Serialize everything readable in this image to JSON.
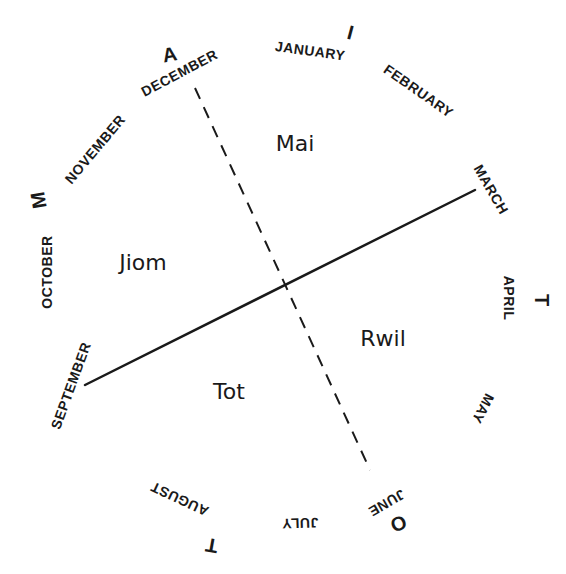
{
  "diagram": {
    "type": "seasonal calendar wheel",
    "months": [
      {
        "label": "JANUARY",
        "x": 310,
        "y": 52,
        "rotate": 8
      },
      {
        "label": "FEBRUARY",
        "x": 418,
        "y": 92,
        "rotate": 35
      },
      {
        "label": "MARCH",
        "x": 490,
        "y": 190,
        "rotate": 60
      },
      {
        "label": "APRIL",
        "x": 508,
        "y": 298,
        "rotate": 90
      },
      {
        "label": "MAY",
        "x": 482,
        "y": 408,
        "rotate": 118
      },
      {
        "label": "JUNE",
        "x": 386,
        "y": 502,
        "rotate": 150
      },
      {
        "label": "JULY",
        "x": 300,
        "y": 522,
        "rotate": 178
      },
      {
        "label": "AUGUST",
        "x": 180,
        "y": 498,
        "rotate": 205
      },
      {
        "label": "SEPTEMBER",
        "x": 72,
        "y": 386,
        "rotate": -70
      },
      {
        "label": "OCTOBER",
        "x": 48,
        "y": 272,
        "rotate": -90
      },
      {
        "label": "NOVEMBER",
        "x": 96,
        "y": 150,
        "rotate": -50
      },
      {
        "label": "DECEMBER",
        "x": 180,
        "y": 74,
        "rotate": -28
      }
    ],
    "markers": [
      {
        "label": "A",
        "x": 170,
        "y": 56,
        "rotate": -10
      },
      {
        "label": "I",
        "x": 350,
        "y": 34,
        "rotate": 15
      },
      {
        "label": "M",
        "x": 40,
        "y": 200,
        "rotate": -100
      },
      {
        "label": "T",
        "x": 540,
        "y": 300,
        "rotate": 90
      },
      {
        "label": "O",
        "x": 398,
        "y": 522,
        "rotate": 160
      },
      {
        "label": "T",
        "x": 212,
        "y": 544,
        "rotate": 190
      }
    ],
    "seasons": [
      {
        "label": "Mai",
        "x": 295,
        "y": 145
      },
      {
        "label": "Jiom",
        "x": 143,
        "y": 264
      },
      {
        "label": "Rwil",
        "x": 383,
        "y": 340
      },
      {
        "label": "Tot",
        "x": 229,
        "y": 393
      }
    ],
    "solid_line": {
      "x1": 85,
      "y1": 385,
      "x2": 475,
      "y2": 190
    },
    "dashed_line": {
      "x1": 195,
      "y1": 88,
      "x2": 370,
      "y2": 470
    },
    "intersection": {
      "x": 283,
      "y": 287
    },
    "ink_color": "#1a1a1a",
    "background": "#ffffff"
  }
}
